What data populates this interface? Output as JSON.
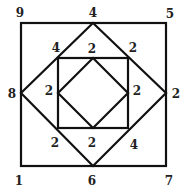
{
  "diagram": {
    "stroke_color": "#111111",
    "background": "#ffffff",
    "shapes": {
      "outer_square": {
        "x1": 21,
        "y1": 23,
        "x2": 166,
        "y2": 166
      },
      "outer_diamond": {
        "top": [
          93,
          23
        ],
        "right": [
          166,
          93
        ],
        "bottom": [
          93,
          166
        ],
        "left": [
          21,
          93
        ]
      },
      "inner_square": {
        "x1": 58,
        "y1": 58,
        "x2": 128,
        "y2": 128
      },
      "inner_diamond": {
        "top": [
          93,
          58
        ],
        "right": [
          128,
          93
        ],
        "bottom": [
          93,
          128
        ],
        "left": [
          58,
          93
        ]
      }
    },
    "labels": [
      {
        "id": "outer-top-left",
        "text": "9",
        "x": 20,
        "y": 13
      },
      {
        "id": "outer-top-mid",
        "text": "4",
        "x": 93,
        "y": 13
      },
      {
        "id": "outer-top-right",
        "text": "5",
        "x": 170,
        "y": 14
      },
      {
        "id": "outer-left-mid",
        "text": "8",
        "x": 12,
        "y": 94
      },
      {
        "id": "outer-right-mid",
        "text": "2",
        "x": 176,
        "y": 94
      },
      {
        "id": "outer-bottom-left",
        "text": "1",
        "x": 19,
        "y": 181
      },
      {
        "id": "outer-bottom-mid",
        "text": "6",
        "x": 92,
        "y": 181
      },
      {
        "id": "outer-bottom-right",
        "text": "7",
        "x": 169,
        "y": 181
      },
      {
        "id": "diamond-upper-left",
        "text": "4",
        "x": 56,
        "y": 48
      },
      {
        "id": "inner-top",
        "text": "2",
        "x": 92,
        "y": 49
      },
      {
        "id": "diamond-upper-right",
        "text": "2",
        "x": 133,
        "y": 48
      },
      {
        "id": "inner-left",
        "text": "2",
        "x": 49,
        "y": 91
      },
      {
        "id": "inner-right",
        "text": "2",
        "x": 137,
        "y": 91
      },
      {
        "id": "diamond-lower-left",
        "text": "2",
        "x": 55,
        "y": 143
      },
      {
        "id": "inner-bottom",
        "text": "2",
        "x": 92,
        "y": 143
      },
      {
        "id": "diamond-lower-right",
        "text": "4",
        "x": 134,
        "y": 145
      }
    ]
  }
}
